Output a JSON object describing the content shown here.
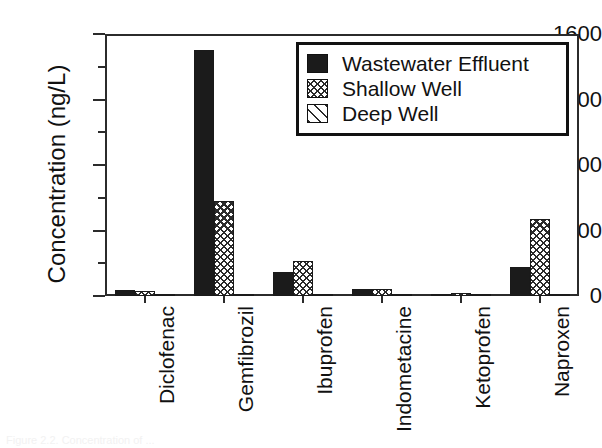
{
  "chart_data": {
    "type": "bar",
    "title": "",
    "xlabel": "",
    "ylabel": "Concentration (ng/L)",
    "ylim": [
      0,
      1600
    ],
    "ytick_values": [
      0,
      400,
      800,
      1200,
      1600
    ],
    "ytick_labels": [
      "0",
      "400",
      "800",
      "1200",
      "1600"
    ],
    "yminor_values": [
      200,
      600,
      1000,
      1400
    ],
    "grid": false,
    "legend_position": "top-right inside",
    "categories": [
      "Diclofenac",
      "Gemfibrozil",
      "Ibuprofen",
      "Indometacine",
      "Ketoprofen",
      "Naproxen"
    ],
    "series": [
      {
        "name": "Wastewater Effluent",
        "pattern": "solid-black",
        "values": [
          35,
          1505,
          145,
          40,
          12,
          180
        ]
      },
      {
        "name": "Shallow Well",
        "pattern": "crosshatch",
        "values": [
          28,
          580,
          215,
          45,
          18,
          468
        ]
      },
      {
        "name": "Deep Well",
        "pattern": "diagonal-hatch",
        "values": [
          10,
          14,
          12,
          8,
          6,
          9
        ]
      }
    ]
  },
  "legend": {
    "entries": [
      {
        "label": "Wastewater Effluent"
      },
      {
        "label": "Shallow Well"
      },
      {
        "label": "Deep Well"
      }
    ]
  },
  "caption": {
    "text": "Figure 2.2. Concentration of ..."
  }
}
